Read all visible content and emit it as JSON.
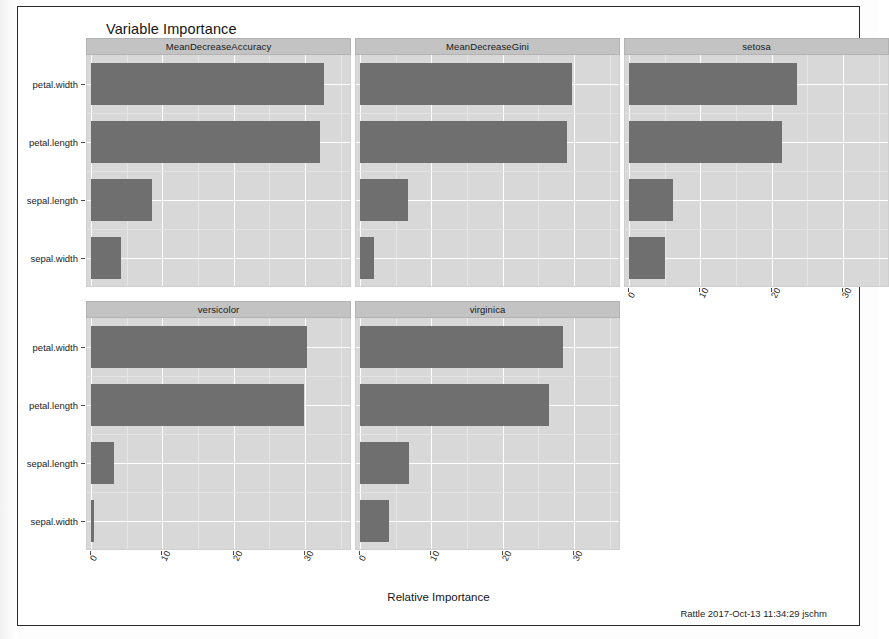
{
  "plot": {
    "title": "Variable Importance",
    "xaxis_title": "Relative Importance",
    "footer": "Rattle 2017-Oct-13 11:34:29 jschm",
    "bar_color": "#6f6f6f",
    "panel_bg": "#d8d8d8",
    "strip_bg": "#c3c3c3",
    "page_bg": "#ffffff"
  },
  "chart_data": {
    "type": "bar",
    "title": "Variable Importance",
    "xlabel": "Relative Importance",
    "ylabel": "",
    "orientation": "horizontal",
    "grid": true,
    "legend": "none",
    "xlim": [
      0,
      36
    ],
    "xticks": [
      0,
      10,
      20,
      30
    ],
    "xticklabels": [
      "0",
      "10",
      "20",
      "30"
    ],
    "categories": [
      "petal.width",
      "petal.length",
      "sepal.length",
      "sepal.width"
    ],
    "panels": [
      {
        "name": "MeanDecreaseAccuracy",
        "row": 0,
        "col": 0,
        "values": [
          32.7,
          32.1,
          8.6,
          4.2
        ]
      },
      {
        "name": "MeanDecreaseGini",
        "row": 0,
        "col": 1,
        "values": [
          29.7,
          29.0,
          6.7,
          1.9
        ]
      },
      {
        "name": "setosa",
        "row": 0,
        "col": 2,
        "values": [
          23.5,
          21.5,
          6.2,
          5.0
        ]
      },
      {
        "name": "versicolor",
        "row": 1,
        "col": 0,
        "values": [
          30.3,
          29.8,
          3.2,
          0.4
        ]
      },
      {
        "name": "virginica",
        "row": 1,
        "col": 1,
        "values": [
          28.5,
          26.5,
          6.8,
          4.0
        ]
      }
    ]
  }
}
